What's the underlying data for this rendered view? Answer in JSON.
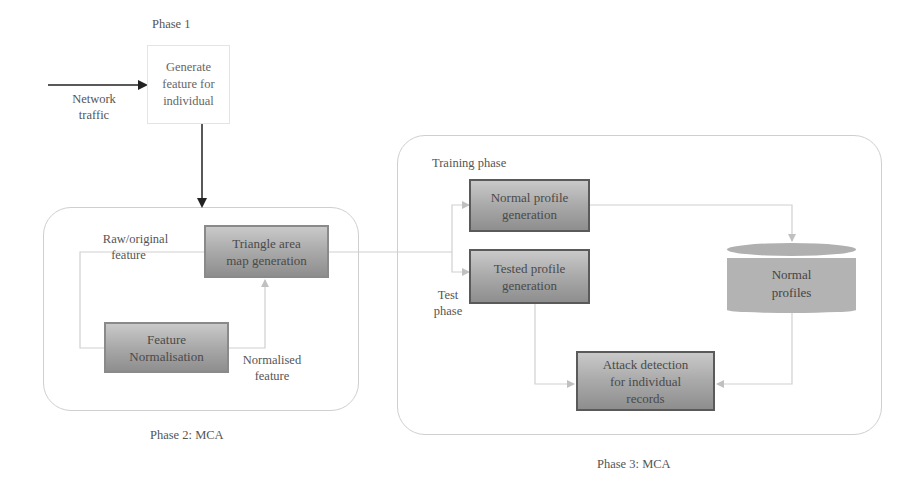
{
  "phase1": {
    "title": "Phase 1",
    "input_label_line1": "Network",
    "input_label_line2": "traffic",
    "box_line1": "Generate",
    "box_line2": "feature for",
    "box_line3": "individual"
  },
  "phase2": {
    "caption": "Phase 2: MCA",
    "triangle_box_line1": "Triangle area",
    "triangle_box_line2": "map generation",
    "normalisation_box_line1": "Feature",
    "normalisation_box_line2": "Normalisation",
    "raw_label_line1": "Raw/original",
    "raw_label_line2": "feature",
    "normalised_label_line1": "Normalised",
    "normalised_label_line2": "feature"
  },
  "phase3": {
    "caption": "Phase 3: MCA",
    "training_label": "Training phase",
    "test_label_line1": "Test",
    "test_label_line2": "phase",
    "normal_profile_box_line1": "Normal profile",
    "normal_profile_box_line2": "generation",
    "tested_profile_box_line1": "Tested profile",
    "tested_profile_box_line2": "generation",
    "database_line1": "Normal",
    "database_line2": "profiles",
    "attack_box_line1": "Attack detection",
    "attack_box_line2": "for individual",
    "attack_box_line3": "records"
  },
  "colors": {
    "box_gradient_top": "#c9c9c9",
    "box_gradient_bottom": "#8e8e8e",
    "box_border": "#5a5a5a",
    "connector": "#c8c8c8",
    "container_border": "#cfcfcf",
    "database_fill": "#b3b3b3"
  }
}
